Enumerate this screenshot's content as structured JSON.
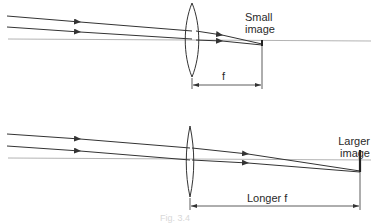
{
  "diagram": {
    "panels": [
      {
        "id": "short-focal-length",
        "image_label_line1": "Small",
        "image_label_line2": "image",
        "dimension_label": "f"
      },
      {
        "id": "long-focal-length",
        "image_label_line1": "Larger",
        "image_label_line2": "image",
        "dimension_label": "Longer f"
      }
    ],
    "caption": "Fig. 3.4",
    "colors": {
      "line": "#333333",
      "axis": "#9a9a9a",
      "text": "#2a2a2a"
    }
  }
}
